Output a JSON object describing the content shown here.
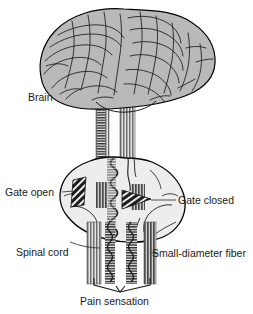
{
  "figure": {
    "background_color": "#ffffff",
    "outline_color": "#000000",
    "brain_fill": "#b9b9b9",
    "cord_fill": "#ededed",
    "fiber_fill": "#7a7a7a",
    "gate_fill": "#1c1c1c",
    "label_color": "#1a1a1a",
    "leader_color": "#3c3c3c"
  },
  "labels": {
    "brain": "Brain",
    "gate_open": "Gate open",
    "gate_closed": "Gate closed",
    "spinal_cord": "Spinal cord",
    "small_diameter_fiber": "Small-diameter fiber",
    "pain_sensation": "Pain sensation"
  },
  "parts": {
    "brain_name": "brain",
    "spinal_cord_name": "spinal-cord-cross-section",
    "gate_open_name": "gate-open-wedge",
    "gate_closed_name": "gate-closed-wedge",
    "ascending_tract_left": "ascending-tract-left",
    "ascending_tract_right": "ascending-tract-right",
    "descending_fiber_1": "descending-fiber-1",
    "descending_fiber_2": "descending-fiber-2",
    "descending_fiber_3": "descending-fiber-3",
    "descending_fiber_4": "descending-fiber-4",
    "brace": "pain-sensation-brace"
  }
}
